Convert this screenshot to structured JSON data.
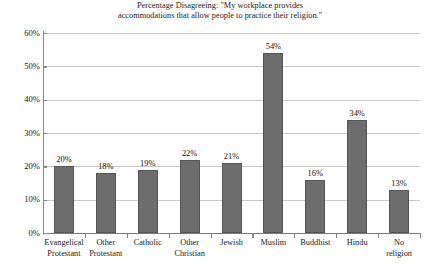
{
  "chart_data": {
    "type": "bar",
    "title": "Percentage Disagreeing: \"My workplace provides accommodations that allow people to practice their religion.\"",
    "title_lines": [
      "Percentage Disagreeing: \"My workplace provides",
      "accommodations that allow people to practice their religion.\""
    ],
    "xlabel": "",
    "ylabel": "",
    "ylim": [
      0,
      60
    ],
    "ytick_values": [
      60,
      50,
      40,
      30,
      20,
      10,
      0
    ],
    "ytick_labels": [
      "60%",
      "50%",
      "40%",
      "30%",
      "20%",
      "10%",
      "0%"
    ],
    "grid": true,
    "legend": false,
    "bar_color": "#6d6d6d",
    "grid_color": "#c9c9c9",
    "axis_color": "#8a8a8a",
    "categories": [
      "Evangelical Protestant",
      "Other Protestant",
      "Catholic",
      "Other Christian",
      "Jewish",
      "Muslim",
      "Buddhist",
      "Hindu",
      "No religion"
    ],
    "category_label_lines": [
      [
        "Evangelical",
        "Protestant"
      ],
      [
        "Other",
        "Protestant"
      ],
      [
        "Catholic"
      ],
      [
        "Other",
        "Christian"
      ],
      [
        "Jewish"
      ],
      [
        "Muslim"
      ],
      [
        "Buddhist"
      ],
      [
        "Hindu"
      ],
      [
        "No",
        "religion"
      ]
    ],
    "values": [
      20,
      18,
      19,
      22,
      21,
      54,
      16,
      34,
      13
    ],
    "value_labels": [
      "20%",
      "18%",
      "19%",
      "22%",
      "21%",
      "54%",
      "16%",
      "34%",
      "13%"
    ]
  }
}
